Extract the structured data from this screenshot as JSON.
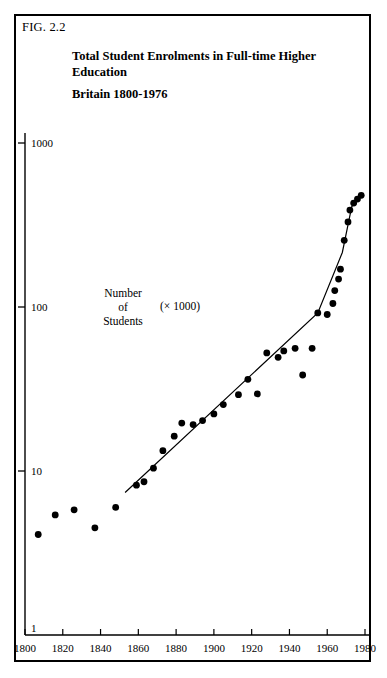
{
  "figure": {
    "label": "FIG. 2.2",
    "title_line1": "Total Student Enrolments in Full-time Higher",
    "title_line2": "Education",
    "title_line3": "Britain 1800-1976"
  },
  "annotation": {
    "line1": "Number",
    "line2": "of",
    "line3": "Students",
    "multiplier": "(× 1000)"
  },
  "colors": {
    "ink": "#000000",
    "paper": "#ffffff",
    "point": "#000000",
    "trend": "#000000"
  },
  "chart_data": {
    "type": "scatter",
    "xlabel": "",
    "ylabel": "Number of Students (× 1000)",
    "yscale": "log",
    "ylim": [
      1,
      1000
    ],
    "xlim": [
      1800,
      1980
    ],
    "grid": false,
    "legend": null,
    "y_ticks": [
      "1",
      "10",
      "100",
      "1000"
    ],
    "y_tick_values": [
      1,
      10,
      100,
      1000
    ],
    "x_ticks": [
      "1800",
      "1820",
      "1840",
      "1860",
      "1880",
      "1900",
      "1920",
      "1940",
      "1960",
      "1980"
    ],
    "x_tick_values": [
      1800,
      1820,
      1840,
      1860,
      1880,
      1900,
      1920,
      1940,
      1960,
      1980
    ],
    "x_minor_step": 20,
    "points": [
      {
        "x": 1807,
        "y": 4.1
      },
      {
        "x": 1816,
        "y": 5.4
      },
      {
        "x": 1826,
        "y": 5.8
      },
      {
        "x": 1837,
        "y": 4.5
      },
      {
        "x": 1848,
        "y": 6.0
      },
      {
        "x": 1859,
        "y": 8.2
      },
      {
        "x": 1863,
        "y": 8.6
      },
      {
        "x": 1868,
        "y": 10.4
      },
      {
        "x": 1873,
        "y": 13.3
      },
      {
        "x": 1879,
        "y": 16.3
      },
      {
        "x": 1883,
        "y": 19.6
      },
      {
        "x": 1889,
        "y": 19.2
      },
      {
        "x": 1894,
        "y": 20.3
      },
      {
        "x": 1900,
        "y": 22.3
      },
      {
        "x": 1905,
        "y": 25.4
      },
      {
        "x": 1913,
        "y": 29.2
      },
      {
        "x": 1918,
        "y": 36.2
      },
      {
        "x": 1923,
        "y": 29.5
      },
      {
        "x": 1928,
        "y": 52.5
      },
      {
        "x": 1934,
        "y": 49.3
      },
      {
        "x": 1937,
        "y": 54.0
      },
      {
        "x": 1943,
        "y": 56.0
      },
      {
        "x": 1947,
        "y": 38.5
      },
      {
        "x": 1952,
        "y": 56.0
      },
      {
        "x": 1955,
        "y": 92.0
      },
      {
        "x": 1960,
        "y": 90.0
      },
      {
        "x": 1963,
        "y": 105.0
      },
      {
        "x": 1964,
        "y": 126.0
      },
      {
        "x": 1966,
        "y": 148.0
      },
      {
        "x": 1967,
        "y": 170.0
      },
      {
        "x": 1969,
        "y": 255.0
      },
      {
        "x": 1971,
        "y": 330.0
      },
      {
        "x": 1972,
        "y": 390.0
      },
      {
        "x": 1974,
        "y": 430.0
      },
      {
        "x": 1976,
        "y": 455.0
      },
      {
        "x": 1978,
        "y": 480.0
      }
    ],
    "trend_line": {
      "label": "fitted trend",
      "from": {
        "x": 1853,
        "y": 7.4
      },
      "to": {
        "x": 1973,
        "y": 410.0
      },
      "vertices": [
        {
          "x": 1853,
          "y": 7.4
        },
        {
          "x": 1955,
          "y": 92.0
        },
        {
          "x": 1968,
          "y": 215.0
        },
        {
          "x": 1973,
          "y": 410.0
        },
        {
          "x": 1978,
          "y": 480.0
        }
      ]
    }
  }
}
